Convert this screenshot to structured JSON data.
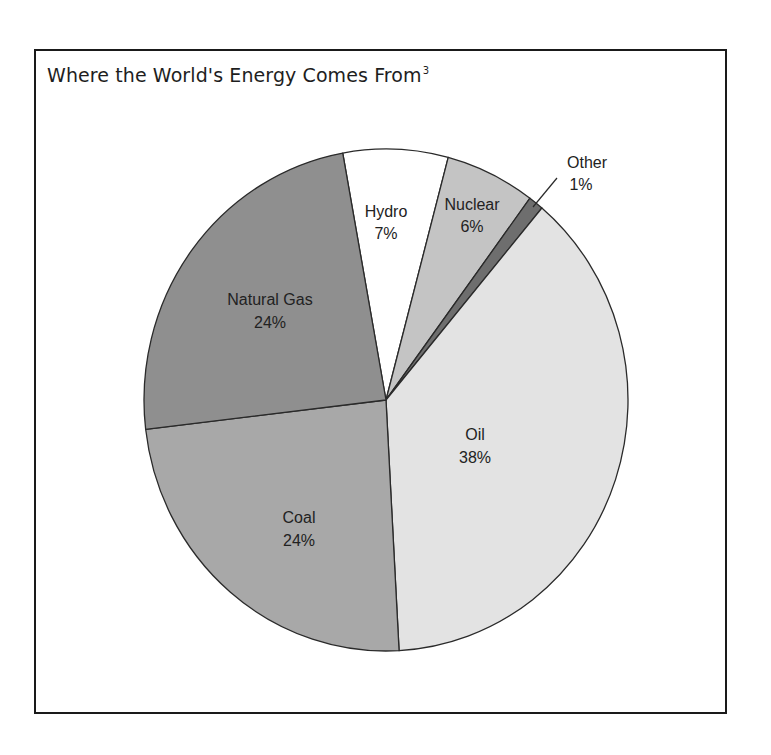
{
  "chart": {
    "title": "Where the World's Energy Comes From",
    "footnote_marker": "3"
  },
  "chart_data": {
    "type": "pie",
    "title": "Where the World's Energy Comes From",
    "footnote_marker": "3",
    "unit": "%",
    "categories": [
      "Hydro",
      "Nuclear",
      "Other",
      "Oil",
      "Coal",
      "Natural Gas"
    ],
    "values": [
      7,
      6,
      1,
      38,
      24,
      24
    ],
    "labels": [
      "7%",
      "6%",
      "1%",
      "38%",
      "24%",
      "24%"
    ],
    "colors": [
      "#ffffff",
      "#c4c4c4",
      "#6e6e6e",
      "#e3e3e3",
      "#a8a8a8",
      "#8f8f8f"
    ],
    "start_angle_deg_clockwise_from_top": -10.3,
    "legend": "none (labels placed on slices; 'Other' uses leader line)",
    "stroke_color": "#2a2a2a"
  },
  "slices": [
    {
      "name": "Hydro",
      "pct": "7%",
      "color": "#ffffff"
    },
    {
      "name": "Nuclear",
      "pct": "6%",
      "color": "#c4c4c4"
    },
    {
      "name": "Other",
      "pct": "1%",
      "color": "#6e6e6e"
    },
    {
      "name": "Oil",
      "pct": "38%",
      "color": "#e3e3e3"
    },
    {
      "name": "Coal",
      "pct": "24%",
      "color": "#a8a8a8"
    },
    {
      "name": "Natural Gas",
      "pct": "24%",
      "color": "#8f8f8f"
    }
  ]
}
